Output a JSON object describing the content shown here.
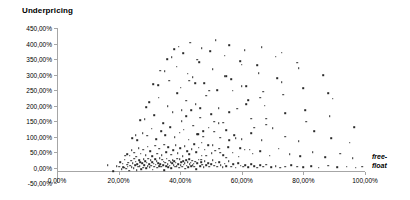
{
  "chart_data": {
    "type": "scatter",
    "title": "Underpricing",
    "xlabel_line1": "free-",
    "xlabel_line2": "float",
    "ylabel": "Underpricing",
    "xlim": [
      0,
      100
    ],
    "ylim": [
      -50,
      450
    ],
    "grid": false,
    "legend": null,
    "marker_color": "#2a2a2a",
    "axis_color": "#a6a6a6",
    "xticks": [
      0,
      20,
      40,
      60,
      80,
      100
    ],
    "xtick_labels": [
      "0,00%",
      "20,00%",
      "40,00%",
      "60,00%",
      "80,00%",
      "100,00%"
    ],
    "yticks": [
      -50,
      0,
      50,
      100,
      150,
      200,
      250,
      300,
      350,
      400,
      450
    ],
    "ytick_labels": [
      "-50,00%",
      "0,00%",
      "50,00%",
      "100,00%",
      "150,00%",
      "200,00%",
      "250,00%",
      "300,00%",
      "350,00%",
      "400,00%",
      "450,00%"
    ],
    "x": [
      16.5,
      18.2,
      19.4,
      20.1,
      20.6,
      21.0,
      21.3,
      21.8,
      22.0,
      22.4,
      22.7,
      23.0,
      23.2,
      23.5,
      23.8,
      24.0,
      24.3,
      24.6,
      24.9,
      25.1,
      25.4,
      25.6,
      25.9,
      26.1,
      26.4,
      26.6,
      26.9,
      27.1,
      27.4,
      27.6,
      27.9,
      28.1,
      28.4,
      28.6,
      28.9,
      29.1,
      29.4,
      29.6,
      29.9,
      30.1,
      30.4,
      30.6,
      30.9,
      31.1,
      31.4,
      31.6,
      31.9,
      32.1,
      32.4,
      32.6,
      32.9,
      33.1,
      33.4,
      33.6,
      33.9,
      34.1,
      34.4,
      34.6,
      34.9,
      35.1,
      35.4,
      35.6,
      35.9,
      36.1,
      36.4,
      36.6,
      36.9,
      37.1,
      37.4,
      37.6,
      37.9,
      38.1,
      38.4,
      38.6,
      38.9,
      39.1,
      39.4,
      39.6,
      39.9,
      40.1,
      40.4,
      40.6,
      40.9,
      41.1,
      41.4,
      41.6,
      41.9,
      42.1,
      42.4,
      42.6,
      42.9,
      43.1,
      43.4,
      43.6,
      43.9,
      44.1,
      44.4,
      44.6,
      44.9,
      45.2,
      45.6,
      46.0,
      46.4,
      46.8,
      47.2,
      47.6,
      48.0,
      48.5,
      49.0,
      49.5,
      50.0,
      50.5,
      51.0,
      51.5,
      52.0,
      52.6,
      53.2,
      53.8,
      54.4,
      55.0,
      55.8,
      56.5,
      57.2,
      58.0,
      58.8,
      59.6,
      60.4,
      61.2,
      62.0,
      63.0,
      64.0,
      65.0,
      66.0,
      67.0,
      68.0,
      69.5,
      71.0,
      72.5,
      74.0,
      76.0,
      78.0,
      80.0,
      82.5,
      85.0,
      88.0,
      91.0,
      94.0,
      97.0,
      99.0,
      21.5,
      22.8,
      23.6,
      24.2,
      25.0,
      25.8,
      26.5,
      27.2,
      28.0,
      28.8,
      29.5,
      30.2,
      31.0,
      31.8,
      32.5,
      33.2,
      34.0,
      34.8,
      35.5,
      36.2,
      37.0,
      37.8,
      38.5,
      39.2,
      40.0,
      40.8,
      41.5,
      42.2,
      43.0,
      43.8,
      44.5,
      45.2,
      46.0,
      47.0,
      48.0,
      49.0,
      50.2,
      51.4,
      52.6,
      54.0,
      55.5,
      57.0,
      59.0,
      61.0,
      63.5,
      66.0,
      69.0,
      72.0,
      75.5,
      79.0,
      83.0,
      87.0,
      92.0,
      96.0,
      22.2,
      24.5,
      26.0,
      27.8,
      29.2,
      30.8,
      32.2,
      33.8,
      35.2,
      36.8,
      38.2,
      39.8,
      41.2,
      42.8,
      44.2,
      45.8,
      47.5,
      49.2,
      51.0,
      53.0,
      55.0,
      57.5,
      60.0,
      63.0,
      66.5,
      70.0,
      74.0,
      78.5,
      83.5,
      89.0,
      95.0,
      25.5,
      28.5,
      31.5,
      34.5,
      37.5,
      40.5,
      43.5,
      46.5,
      50.0,
      54.0,
      58.5,
      63.0,
      68.0,
      74.0,
      81.0,
      88.5,
      96.5,
      27.0,
      30.0,
      33.0,
      36.0,
      39.0,
      42.0,
      45.0,
      48.5,
      52.5,
      57.0,
      62.0,
      67.5,
      73.5,
      80.5,
      89.5,
      29.0,
      32.8,
      36.5,
      40.2,
      44.0,
      47.8,
      52.0,
      56.5,
      61.5,
      67.0,
      73.0,
      80.0,
      88.0,
      31.2,
      35.0,
      38.8,
      42.5,
      46.2,
      50.5,
      55.0,
      60.0,
      65.5,
      71.5,
      78.5,
      86.5,
      33.5,
      37.2,
      41.0,
      45.5,
      49.8,
      54.5,
      59.5,
      65.0,
      71.0,
      78.0,
      35.8,
      39.5,
      43.2,
      47.0,
      51.5,
      56.0,
      61.0,
      66.5,
      73.0,
      38.0,
      42.0,
      46.5,
      51.0,
      56.0,
      61.5,
      68.0,
      40.5,
      44.8,
      49.5,
      54.5,
      60.0,
      66.0,
      43.0,
      47.5,
      52.5,
      58.0,
      64.0,
      45.5,
      50.5,
      56.0,
      62.5,
      47.0,
      53.0,
      59.5,
      48.5,
      55.0,
      46.8
    ],
    "y": [
      8,
      -12,
      4,
      2,
      18,
      -6,
      12,
      0,
      25,
      -4,
      9,
      3,
      16,
      -10,
      6,
      22,
      1,
      14,
      -3,
      28,
      7,
      19,
      -8,
      11,
      2,
      24,
      5,
      17,
      -5,
      13,
      0,
      26,
      8,
      20,
      -2,
      15,
      4,
      29,
      10,
      1,
      23,
      6,
      18,
      -7,
      12,
      3,
      27,
      9,
      21,
      -1,
      14,
      5,
      30,
      11,
      2,
      25,
      7,
      19,
      -9,
      16,
      4,
      28,
      10,
      1,
      22,
      6,
      18,
      -3,
      13,
      24,
      8,
      20,
      2,
      15,
      5,
      29,
      11,
      0,
      26,
      7,
      17,
      3,
      21,
      9,
      14,
      -4,
      23,
      6,
      18,
      1,
      27,
      10,
      16,
      4,
      22,
      8,
      12,
      2,
      19,
      -6,
      13,
      25,
      5,
      17,
      9,
      1,
      20,
      7,
      14,
      3,
      11,
      23,
      6,
      16,
      2,
      18,
      8,
      1,
      12,
      5,
      20,
      3,
      10,
      0,
      14,
      6,
      2,
      8,
      1,
      11,
      4,
      0,
      7,
      2,
      9,
      1,
      5,
      0,
      3,
      8,
      2,
      1,
      4,
      0,
      6,
      1,
      3,
      0,
      2,
      1,
      42,
      38,
      55,
      48,
      35,
      62,
      44,
      58,
      40,
      67,
      52,
      36,
      70,
      45,
      60,
      39,
      74,
      50,
      65,
      41,
      56,
      72,
      47,
      63,
      37,
      68,
      53,
      43,
      59,
      75,
      49,
      64,
      38,
      57,
      71,
      46,
      54,
      61,
      40,
      66,
      48,
      35,
      58,
      44,
      52,
      38,
      60,
      42,
      36,
      50,
      33,
      45,
      30,
      38,
      95,
      88,
      110,
      102,
      125,
      92,
      118,
      105,
      130,
      98,
      112,
      122,
      90,
      135,
      108,
      100,
      128,
      115,
      96,
      120,
      104,
      92,
      110,
      88,
      126,
      99,
      85,
      118,
      94,
      80,
      105,
      155,
      168,
      142,
      178,
      150,
      185,
      160,
      172,
      145,
      190,
      158,
      138,
      175,
      148,
      165,
      130,
      152,
      210,
      225,
      198,
      240,
      215,
      205,
      232,
      192,
      248,
      218,
      200,
      235,
      185,
      222,
      195,
      265,
      280,
      258,
      292,
      272,
      250,
      285,
      262,
      245,
      275,
      255,
      240,
      268,
      310,
      325,
      302,
      340,
      318,
      295,
      332,
      305,
      288,
      320,
      298,
      312,
      355,
      368,
      348,
      375,
      360,
      342,
      330,
      358,
      338,
      350,
      390,
      402,
      385,
      410,
      395,
      378,
      388,
      370,
      382,
      165,
      192,
      148,
      178,
      205,
      158,
      185,
      272,
      248,
      295,
      262,
      225,
      280,
      118,
      142,
      95,
      128,
      108,
      72,
      88,
      58,
      80,
      48,
      62,
      38,
      32,
      25,
      440
    ]
  }
}
